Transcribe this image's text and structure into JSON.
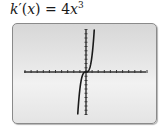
{
  "title": {
    "fn": "k",
    "prime": "′",
    "open": "(",
    "var": "x",
    "close": ")",
    "eq": " = 4",
    "var2": "x",
    "exp": "3"
  },
  "chart_data": {
    "type": "line",
    "xlabel": "",
    "ylabel": "",
    "grid": false,
    "legend": null,
    "xlim": [
      -10,
      10
    ],
    "ylim": [
      -10,
      10
    ],
    "tick_marks": true,
    "series": [
      {
        "name": "k′(x) = 4x³",
        "x": [
          -1.35,
          -1.2,
          -1.0,
          -0.8,
          -0.6,
          -0.4,
          -0.2,
          0,
          0.2,
          0.4,
          0.6,
          0.8,
          1.0,
          1.2,
          1.35
        ],
        "y": [
          -9.84,
          -6.91,
          -4.0,
          -2.05,
          -0.86,
          -0.26,
          -0.03,
          0,
          0.03,
          0.26,
          0.86,
          2.05,
          4.0,
          6.91,
          9.84
        ]
      }
    ]
  },
  "colors": {
    "curve": "#1a1a1a",
    "axis": "#333333",
    "frame_border": "#8a8a8a",
    "frame_bg": "#e6e6e6"
  }
}
